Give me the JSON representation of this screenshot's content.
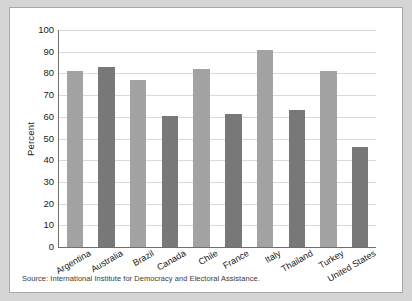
{
  "figure": {
    "source_note": "Source: International Institute for Democracy and Electoral Assistance.",
    "colors": {
      "bar_light": "#a3a3a3",
      "bar_dark": "#787878",
      "axis": "#6e6e6e",
      "gridline": "#d9d9d9",
      "panel_background": "#ffffff",
      "mat_background": "#d5d5d5"
    }
  },
  "chart_data": {
    "type": "bar",
    "title": "",
    "xlabel": "",
    "ylabel": "Percent",
    "ylim": [
      0,
      100
    ],
    "ytick_step": 10,
    "yticks": [
      0,
      10,
      20,
      30,
      40,
      50,
      60,
      70,
      80,
      90,
      100
    ],
    "ytick_labels": [
      "0",
      "10",
      "20",
      "30",
      "40",
      "50",
      "60",
      "70",
      "80",
      "90",
      "100"
    ],
    "grid": "horizontal",
    "legend": "none",
    "categories": [
      "Argentina",
      "Australia",
      "Brazil",
      "Canada",
      "Chile",
      "France",
      "Italy",
      "Thailand",
      "Turkey",
      "United States"
    ],
    "values": [
      81,
      83,
      77,
      60.5,
      82,
      61.5,
      91,
      63,
      81,
      46
    ],
    "bar_colors": [
      "#a3a3a3",
      "#787878",
      "#a3a3a3",
      "#787878",
      "#a3a3a3",
      "#787878",
      "#a3a3a3",
      "#787878",
      "#a3a3a3",
      "#787878"
    ]
  }
}
